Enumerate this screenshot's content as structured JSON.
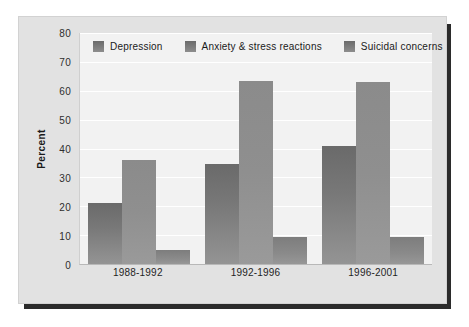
{
  "chart_data": {
    "type": "bar",
    "title": "",
    "xlabel": "",
    "ylabel": "Percent",
    "ylim": [
      0,
      80
    ],
    "ytick_step": 10,
    "yticks": [
      80,
      70,
      60,
      50,
      40,
      30,
      20,
      10,
      0
    ],
    "grid": true,
    "legend_position": "top-inside",
    "categories": [
      "1988-1992",
      "1992-1996",
      "1996-2001"
    ],
    "series": [
      {
        "name": "Depression",
        "values": [
          21,
          34.5,
          41
        ],
        "color": "#787878"
      },
      {
        "name": "Anxiety & stress reactions",
        "values": [
          36,
          63.5,
          63
        ],
        "color": "#8f8f8f"
      },
      {
        "name": "Suicidal concerns",
        "values": [
          5,
          9.3,
          9.3
        ],
        "color": "#8a8a8a"
      }
    ]
  },
  "legend": {
    "items": [
      {
        "label": "Depression"
      },
      {
        "label": "Anxiety & stress reactions"
      },
      {
        "label": "Suicidal concerns"
      }
    ]
  },
  "colors": {
    "page_background": "#ffffff",
    "card_background": "#e2e2e2",
    "plot_background": "#f2f2f2",
    "gridline": "#ffffff",
    "shadow": "#2b2b2b",
    "text": "#1a1a1a"
  }
}
